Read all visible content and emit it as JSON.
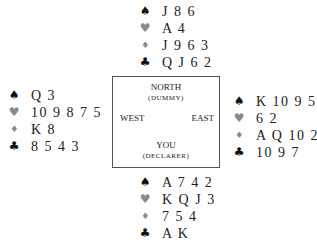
{
  "diagram": {
    "type": "bridge-deal",
    "table": {
      "north_label": "NORTH",
      "north_role": "(DUMMY)",
      "west_label": "WEST",
      "east_label": "EAST",
      "south_label": "YOU",
      "south_role": "(DECLARER)"
    },
    "suit_symbols": {
      "spades": "♠",
      "hearts": "♥",
      "diamonds": "♦",
      "clubs": "♣"
    },
    "hands": {
      "north": {
        "spades": "J 8 6",
        "hearts": "A 4",
        "diamonds": "J 9 6 3",
        "clubs": "Q J 6 2"
      },
      "west": {
        "spades": "Q 3",
        "hearts": "10 9 8 7 5",
        "diamonds": "K 8",
        "clubs": "8 5 4 3"
      },
      "east": {
        "spades": "K 10 9 5",
        "hearts": "6 2",
        "diamonds": "A Q 10 2",
        "clubs": "10 9 7"
      },
      "south": {
        "spades": "A 7 4 2",
        "hearts": "K Q J 3",
        "diamonds": "7 5 4",
        "clubs": "A K"
      }
    },
    "colors": {
      "black_suit": "#111111",
      "red_suit": "#8a8a8a",
      "box_border": "#555555"
    }
  }
}
